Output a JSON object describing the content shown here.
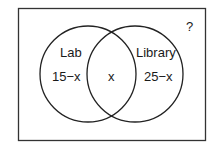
{
  "diagram": {
    "type": "venn",
    "universe_label": "?",
    "sets": [
      {
        "name": "Lab",
        "region_only": "15−x"
      },
      {
        "name": "Library",
        "region_only": "25−x"
      }
    ],
    "intersection": "x"
  }
}
